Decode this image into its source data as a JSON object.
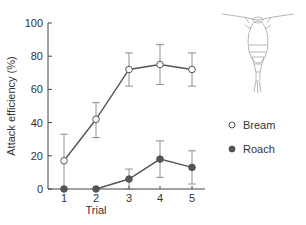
{
  "chart_data": {
    "type": "line",
    "title": "",
    "xlabel": "Trial",
    "ylabel": "Attack efficiency (%)",
    "categories": [
      "1",
      "2",
      "3",
      "4",
      "5"
    ],
    "ylim": [
      0,
      100
    ],
    "yticks": [
      "0",
      "20",
      "40",
      "60",
      "80",
      "100"
    ],
    "grid": false,
    "legend_position": "right",
    "series": [
      {
        "name": "Bream",
        "marker": "open-circle",
        "values": [
          17,
          42,
          72,
          75,
          72
        ],
        "err_low": [
          0,
          31,
          62,
          63,
          62
        ],
        "err_high": [
          33,
          52,
          82,
          87,
          82
        ]
      },
      {
        "name": "Roach",
        "marker": "filled-circle",
        "values": [
          0,
          0,
          6,
          18,
          13
        ],
        "err_low": [
          0,
          0,
          0,
          7,
          3
        ],
        "err_high": [
          0,
          0,
          12,
          29,
          23
        ]
      }
    ],
    "annotations": [
      "copepod illustration (top right)"
    ]
  },
  "legend": {
    "items": [
      {
        "label": "Bream"
      },
      {
        "label": "Roach"
      }
    ]
  },
  "colors": {
    "line": "#555555",
    "marker_fill_open": "#ffffff",
    "marker_fill_filled": "#555555",
    "axis": "#444444"
  }
}
